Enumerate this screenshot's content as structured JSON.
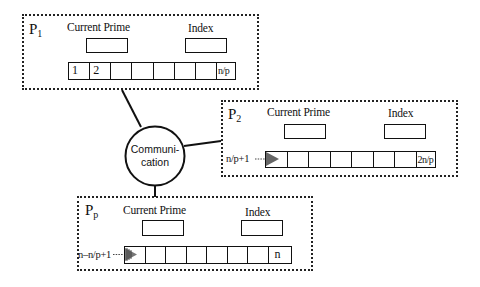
{
  "diagram": {
    "communication_node": {
      "label_line1": "Communi-",
      "label_line2": "cation"
    },
    "processors": [
      {
        "id": "P1",
        "label_main": "P",
        "label_sub": "1",
        "current_prime_label": "Current Prime",
        "index_label": "Index",
        "array_start_label": "",
        "array_cells": [
          "1",
          "2",
          "",
          "",
          "",
          "",
          "",
          "n/p"
        ]
      },
      {
        "id": "P2",
        "label_main": "P",
        "label_sub": "2",
        "current_prime_label": "Current Prime",
        "index_label": "Index",
        "array_start_label": "n/p+1",
        "array_cells": [
          "",
          "",
          "",
          "",
          "",
          "",
          "",
          "2n/p"
        ]
      },
      {
        "id": "Pp",
        "label_main": "P",
        "label_sub": "p",
        "current_prime_label": "Current Prime",
        "index_label": "Index",
        "array_start_label": "n–n/p+1",
        "array_cells": [
          "",
          "",
          "",
          "",
          "",
          "",
          "",
          "n"
        ]
      }
    ]
  }
}
